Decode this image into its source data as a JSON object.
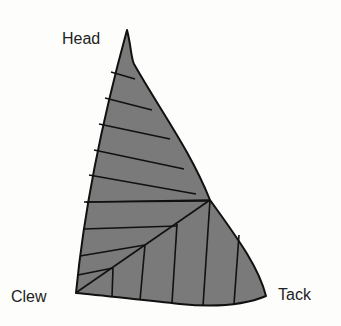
{
  "diagram": {
    "type": "sail-panel-layout",
    "colors": {
      "sail_fill": "#7a7a7a",
      "line": "#111111",
      "background": "#fdfdfb"
    },
    "labels": {
      "head": "Head",
      "clew": "Clew",
      "tack": "Tack"
    },
    "panels": {
      "upper_horizontal_seams": 9,
      "lower_vertical_seams": 5,
      "mitre_seam": "diagonal from clew toward luff"
    }
  }
}
